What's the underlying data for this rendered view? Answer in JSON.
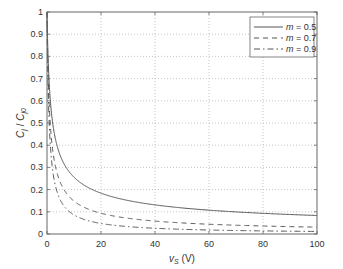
{
  "chart_data": {
    "type": "line",
    "title": "",
    "xlabel": "v_S (V)",
    "xlabel_main": "v",
    "xlabel_sub": "S",
    "xlabel_unit": " (V)",
    "ylabel": "C_j / C_j0",
    "ylabel_parts": {
      "c1": "C",
      "s1": "j",
      "slash": " / ",
      "c2": "C",
      "s2": "j0"
    },
    "xlim": [
      0,
      100
    ],
    "ylim": [
      0,
      1
    ],
    "xticks": [
      0,
      20,
      40,
      60,
      80,
      100
    ],
    "yticks": [
      0,
      0.1,
      0.2,
      0.3,
      0.4,
      0.5,
      0.6,
      0.7,
      0.8,
      0.9,
      1
    ],
    "ytick_labels": [
      "0",
      "0.1",
      "0.2",
      "0.3",
      "0.4",
      "0.5",
      "0.6",
      "0.7",
      "0.8",
      "0.9",
      "1"
    ],
    "grid": true,
    "legend_position": "upper right",
    "model": "C_j/C_j0 = (1 + v_S/phi)^(-m), phi ≈ 0.7 V",
    "phi": 0.7,
    "x": [
      0,
      1,
      2,
      5,
      10,
      20,
      40,
      60,
      80,
      100
    ],
    "series": [
      {
        "name": "m = 0.5",
        "m": 0.5,
        "style": "solid",
        "values": [
          1.0,
          0.64,
          0.51,
          0.35,
          0.26,
          0.18,
          0.13,
          0.11,
          0.09,
          0.08
        ]
      },
      {
        "name": "m = 0.7",
        "m": 0.7,
        "style": "dashed",
        "values": [
          1.0,
          0.53,
          0.39,
          0.23,
          0.15,
          0.09,
          0.06,
          0.04,
          0.04,
          0.03
        ]
      },
      {
        "name": "m = 0.9",
        "m": 0.9,
        "style": "dashdot",
        "values": [
          1.0,
          0.45,
          0.3,
          0.15,
          0.09,
          0.05,
          0.03,
          0.02,
          0.01,
          0.01
        ]
      }
    ]
  },
  "legend": {
    "items": [
      {
        "var": "m",
        "rest": " = 0.5"
      },
      {
        "var": "m",
        "rest": " = 0.7"
      },
      {
        "var": "m",
        "rest": " = 0.9"
      }
    ]
  },
  "colors": {
    "line": "#555555",
    "axis": "#666666",
    "grid": "#b8b8b8"
  }
}
